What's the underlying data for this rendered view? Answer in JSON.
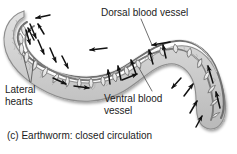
{
  "figure": {
    "caption": "(c) Earthworm: closed circulation",
    "background_color": "#ffffff",
    "text_color": "#1c1c1c",
    "body_fill_color": "#d2d2d2",
    "body_outline_color": "#8a8a8a",
    "vessel_fill_color": "#efefef",
    "vessel_line_color": "#6f6f6f",
    "arrow_color": "#111111",
    "leader_line_color": "#555555"
  },
  "labels": {
    "dorsal": {
      "text": "Dorsal blood vessel",
      "lines": [
        "Dorsal blood vessel"
      ]
    },
    "lateral": {
      "text": "Lateral hearts",
      "line1": "Lateral",
      "line2": "hearts"
    },
    "ventral": {
      "text": "Ventral blood vessel",
      "line1": "Ventral blood",
      "line2": "vessel"
    }
  },
  "anatomy": {
    "organism": "earthworm",
    "circulation_type": "closed",
    "structures": [
      "dorsal blood vessel",
      "ventral blood vessel",
      "lateral hearts",
      "segmental connecting vessels",
      "segmented body wall"
    ],
    "flow": {
      "dorsal_direction": "anterior (toward head, leftward)",
      "ventral_direction": "posterior (toward tail, rightward)",
      "connecting_direction": "ventral to dorsal (upward in mid-body)"
    }
  }
}
